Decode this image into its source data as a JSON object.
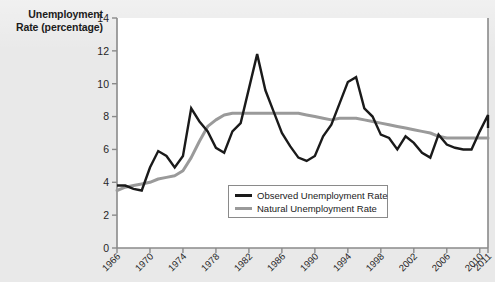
{
  "figure": {
    "axis_title_line1": "Unemployment",
    "axis_title_line2": "Rate (percentage)"
  },
  "legend": {
    "observed_label": "Observed Unemployment Rate",
    "natural_label": "Natural Unemployment Rate",
    "observed_color": "#1a1a1a",
    "natural_color": "#9a9a9a"
  },
  "chart_data": {
    "type": "line",
    "title": "",
    "xlabel": "",
    "ylabel": "Unemployment Rate (percentage)",
    "xlim": [
      1966,
      2011
    ],
    "ylim": [
      0,
      14
    ],
    "yticks": [
      0,
      2,
      4,
      6,
      8,
      10,
      12,
      14
    ],
    "xticks": [
      1966,
      1970,
      1974,
      1978,
      1982,
      1986,
      1990,
      1994,
      1998,
      2002,
      2006,
      2010,
      2011
    ],
    "grid": false,
    "legend_position": "inside-lower-center",
    "x": [
      1966,
      1967,
      1968,
      1969,
      1970,
      1971,
      1972,
      1973,
      1974,
      1975,
      1976,
      1977,
      1978,
      1979,
      1980,
      1981,
      1982,
      1983,
      1984,
      1985,
      1986,
      1987,
      1988,
      1989,
      1990,
      1991,
      1992,
      1993,
      1994,
      1995,
      1996,
      1997,
      1998,
      1999,
      2000,
      2001,
      2002,
      2003,
      2004,
      2005,
      2006,
      2007,
      2008,
      2009,
      2010,
      2011
    ],
    "series": [
      {
        "name": "Observed Unemployment Rate",
        "color": "#1a1a1a",
        "values": [
          3.8,
          3.8,
          3.6,
          3.5,
          4.9,
          5.9,
          5.6,
          4.9,
          5.6,
          8.5,
          7.7,
          7.1,
          6.1,
          5.8,
          7.1,
          7.6,
          9.7,
          11.8,
          9.6,
          8.3,
          7.0,
          6.2,
          5.5,
          5.3,
          5.6,
          6.8,
          7.5,
          8.8,
          10.1,
          10.4,
          8.5,
          8.0,
          6.9,
          6.7,
          6.0,
          6.8,
          6.4,
          5.8,
          5.5,
          6.9,
          6.3,
          6.1,
          6.0,
          6.0,
          7.1,
          8.1
        ],
        "end_value": 7.3
      },
      {
        "name": "Natural Unemployment Rate",
        "color": "#9a9a9a",
        "values": [
          3.5,
          3.7,
          3.8,
          3.9,
          4.0,
          4.2,
          4.3,
          4.4,
          4.7,
          5.5,
          6.5,
          7.4,
          7.8,
          8.1,
          8.2,
          8.2,
          8.2,
          8.2,
          8.2,
          8.2,
          8.2,
          8.2,
          8.2,
          8.1,
          8.0,
          7.9,
          7.8,
          7.9,
          7.9,
          7.9,
          7.8,
          7.7,
          7.6,
          7.5,
          7.4,
          7.3,
          7.2,
          7.1,
          7.0,
          6.8,
          6.7,
          6.7,
          6.7,
          6.7,
          6.7,
          6.7
        ],
        "end_value": 6.7
      }
    ],
    "notes": {
      "observed_peak_1983": 11.8,
      "observed_peak_1995": 10.4,
      "observed_trough_1969": 3.5,
      "observed_final_2011": 7.3,
      "natural_plateau": 8.2
    }
  }
}
